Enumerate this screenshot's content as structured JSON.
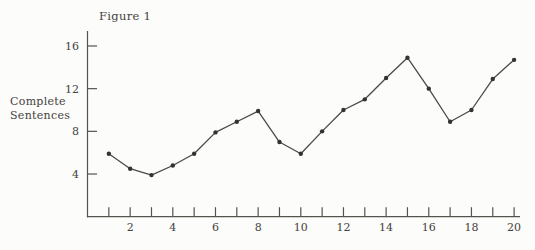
{
  "chart_data": {
    "type": "line",
    "title": "Figure 1",
    "ylabel": "Complete Sentences",
    "ylabel_lines": [
      "Complete",
      "Sentences"
    ],
    "xlabel": "",
    "x": [
      1,
      2,
      3,
      4,
      5,
      6,
      7,
      8,
      9,
      10,
      11,
      12,
      13,
      14,
      15,
      16,
      17,
      18,
      19,
      20
    ],
    "values": [
      5.9,
      4.5,
      3.9,
      4.8,
      5.9,
      7.9,
      8.9,
      9.9,
      7.0,
      5.9,
      8.0,
      10.0,
      11.0,
      13.0,
      14.9,
      12.0,
      8.9,
      10.0,
      12.9,
      14.7
    ],
    "y_ticks": [
      4,
      8,
      12,
      16
    ],
    "x_tick_labels": [
      2,
      4,
      6,
      8,
      10,
      12,
      14,
      16,
      18,
      20
    ],
    "xlim": [
      0,
      20.5
    ],
    "ylim": [
      0,
      17.4
    ],
    "grid": false,
    "legend": "none",
    "marker": "dot",
    "line_color": "#4a4a46",
    "marker_color": "#33332f",
    "axis_color": "#55534e",
    "text_color": "#44423c",
    "background": "#fcfcfa"
  }
}
